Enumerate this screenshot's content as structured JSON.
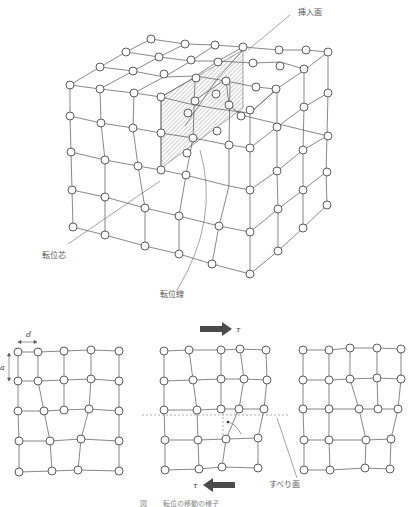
{
  "figure": {
    "caption": "図　　 転位の移動の様子",
    "cube": {
      "labels": {
        "insertion_plane": "挿入面",
        "dislocation_core": "転位芯",
        "dislocation_line": "転位線"
      }
    },
    "panels": {
      "left": {
        "spacing_horizontal": "d",
        "spacing_vertical": "a"
      },
      "middle": {
        "shear_top": "τ",
        "shear_bottom": "τ",
        "slip_plane": "すべり面"
      },
      "right": {}
    }
  },
  "colors": {
    "line": "#555555",
    "atom_stroke": "#333333",
    "hatch": "#888888",
    "arrow_fill": "#4a4a4a",
    "text": "#555555"
  }
}
